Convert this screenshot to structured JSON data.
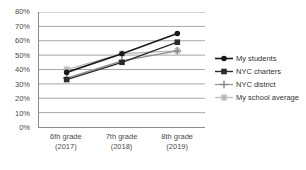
{
  "chart_data": {
    "type": "line",
    "title": "",
    "subtitle": "",
    "xlabel": "",
    "ylabel": "",
    "categories": [
      "6th grade (2017)",
      "7th grade (2018)",
      "8th grade (2019)"
    ],
    "category_lines": [
      [
        "6th grade",
        "(2017)"
      ],
      [
        "7th grade",
        "(2018)"
      ],
      [
        "8th grade",
        "(2019)"
      ]
    ],
    "ylim": [
      0,
      80
    ],
    "ytick_values": [
      0,
      10,
      20,
      30,
      40,
      50,
      60,
      70,
      80
    ],
    "ytick_labels": [
      "0%",
      "10%",
      "20%",
      "30%",
      "40%",
      "50%",
      "60%",
      "70%",
      "80%"
    ],
    "grid": true,
    "grid_axis": "y",
    "legend_position": "right",
    "series": [
      {
        "name": "My students",
        "values": [
          38,
          51,
          65
        ],
        "color": "#1a1a1a",
        "marker": "circle",
        "line_width": 1.6
      },
      {
        "name": "NYC charters",
        "values": [
          33,
          45,
          59
        ],
        "color": "#2b2b2b",
        "marker": "square",
        "line_width": 1.4
      },
      {
        "name": "NYC district",
        "values": [
          34,
          46,
          53
        ],
        "color": "#8f8f8f",
        "marker": "plus",
        "line_width": 1.2
      },
      {
        "name": "My school average",
        "values": [
          40,
          51,
          53
        ],
        "color": "#b5b5b5",
        "marker": "star",
        "line_width": 1.2
      }
    ]
  },
  "legend": {
    "items": [
      {
        "label": "My students"
      },
      {
        "label": "NYC charters"
      },
      {
        "label": "NYC district"
      },
      {
        "label": "My school average"
      }
    ]
  },
  "colors": {
    "axis": "#8a8a8a",
    "grid": "#9b9b9b",
    "tick_text": "#4a4a4a",
    "legend_text": "#333333",
    "background": "#ffffff"
  }
}
